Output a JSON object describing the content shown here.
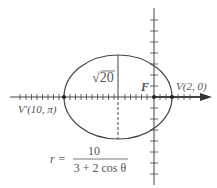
{
  "diagram": {
    "type": "ellipse-polar",
    "labels": {
      "semi_minor": "√20",
      "focus": "F",
      "vertex_right": "V(2, 0)",
      "vertex_left": "V′(10, π)"
    },
    "equation": {
      "lhs": "r =",
      "numerator": "10",
      "denominator": "3 + 2 cos θ"
    },
    "colors": {
      "stroke": "#444444",
      "text": "#555555"
    }
  }
}
